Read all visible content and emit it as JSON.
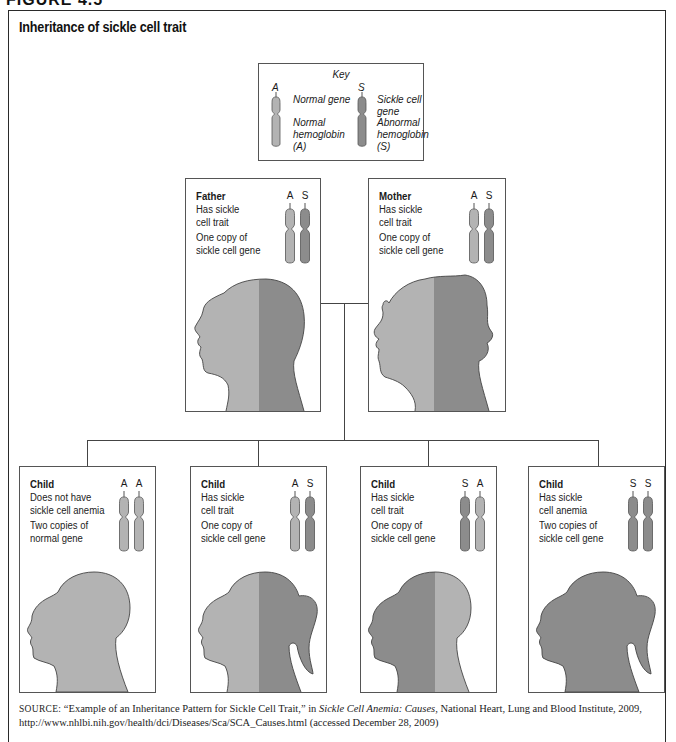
{
  "figure": {
    "label": "FIGURE 4.5",
    "title": "Inheritance of sickle cell trait"
  },
  "colors": {
    "normal": "#b3b3b3",
    "sickle": "#8c8c8c",
    "outline": "#555555",
    "frame": "#2a2a2a"
  },
  "key": {
    "title": "Key",
    "normal": {
      "letter": "A",
      "gene_label": "Normal gene",
      "hemoglobin_label": "Normal\nhemoglobin\n(A)"
    },
    "sickle": {
      "letter": "S",
      "gene_label": "Sickle cell gene",
      "hemoglobin_label": "Abnormal\nhemoglobin\n(S)"
    }
  },
  "parents": [
    {
      "name": "Father",
      "status": "Has sickle\ncell trait",
      "copies": "One copy of\nsickle cell gene",
      "alleles": [
        "A",
        "S"
      ]
    },
    {
      "name": "Mother",
      "status": "Has sickle\ncell trait",
      "copies": "One copy of\nsickle cell gene",
      "alleles": [
        "A",
        "S"
      ]
    }
  ],
  "children": [
    {
      "name": "Child",
      "status": "Does not have\nsickle cell anemia",
      "copies": "Two copies of\nnormal gene",
      "alleles": [
        "A",
        "A"
      ]
    },
    {
      "name": "Child",
      "status": "Has sickle\ncell trait",
      "copies": "One copy of\nsickle cell gene",
      "alleles": [
        "A",
        "S"
      ]
    },
    {
      "name": "Child",
      "status": "Has sickle\ncell trait",
      "copies": "One copy of\nsickle cell gene",
      "alleles": [
        "S",
        "A"
      ]
    },
    {
      "name": "Child",
      "status": "Has sickle\ncell anemia",
      "copies": "Two copies of\nsickle cell gene",
      "alleles": [
        "S",
        "S"
      ]
    }
  ],
  "source": {
    "prefix": "SOURCE:",
    "quote": "“Example of an Inheritance Pattern for Sickle Cell Trait,” in ",
    "publication": "Sickle Cell Anemia: Causes",
    "rest": ", National Heart, Lung and Blood Institute, 2009, http://www.nhlbi.nih.gov/health/dci/Diseases/Sca/SCA_Causes.html (accessed December 28, 2009)"
  }
}
